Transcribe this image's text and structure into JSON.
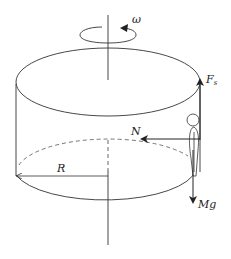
{
  "diagram": {
    "labels": {
      "omega": "ω",
      "friction_main": "F",
      "friction_sub": "s",
      "normal": "N",
      "radius": "R",
      "weight": "Mg"
    },
    "colors": {
      "stroke": "#333333",
      "dashed": "#666666",
      "background": "#ffffff"
    }
  }
}
